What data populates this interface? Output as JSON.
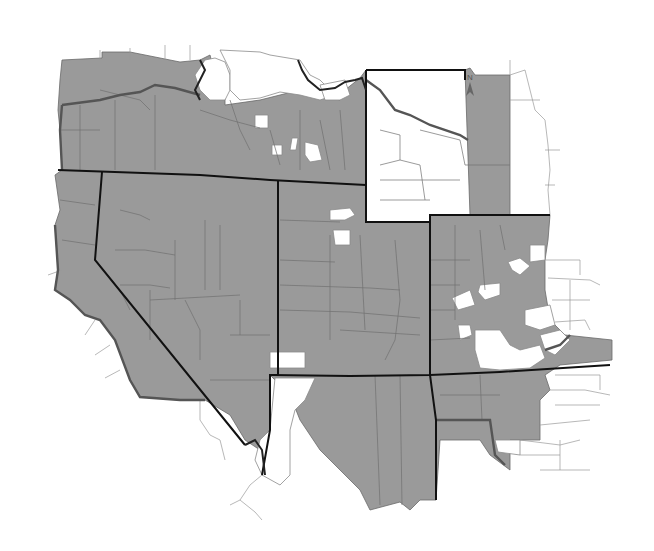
{
  "map": {
    "type": "choropleth",
    "subject": "Western United States counties",
    "fill_colors": {
      "shaded": "#9a9a9a",
      "unshaded": "#ffffff",
      "state_border": "#111111",
      "region_border": "#555555"
    },
    "states_shown": [
      "Oregon",
      "Idaho",
      "Wyoming",
      "Nevada",
      "Utah",
      "Colorado",
      "Arizona",
      "New Mexico"
    ],
    "north_arrow": {
      "label": "N"
    },
    "legend": null
  }
}
